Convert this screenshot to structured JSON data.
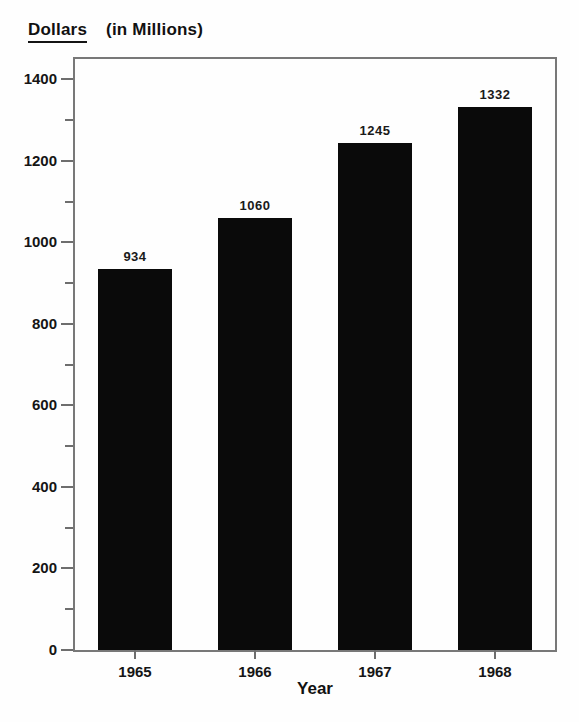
{
  "title": {
    "word": "Dollars",
    "suffix": "(in Millions)"
  },
  "chart_data": {
    "type": "bar",
    "title": "Dollars (in Millions)",
    "categories": [
      "1965",
      "1966",
      "1967",
      "1968"
    ],
    "values": [
      934,
      1060,
      1245,
      1332
    ],
    "bar_labels": [
      "934",
      "1060",
      "1245",
      "1332"
    ],
    "xlabel": "Year",
    "ylabel": "Dollars (in Millions)",
    "ylim": [
      0,
      1450
    ],
    "y_major_ticks": [
      0,
      200,
      400,
      600,
      800,
      1000,
      1200,
      1400
    ],
    "y_minor_ticks": [
      100,
      300,
      500,
      700,
      900,
      1100,
      1300
    ],
    "grid": false,
    "legend": false,
    "bar_color": "#0a0a0a",
    "frame_color": "#787878",
    "text_color": "#111111",
    "background_color": "#fefefe"
  }
}
